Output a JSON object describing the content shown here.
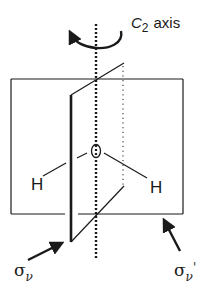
{
  "diagram": {
    "molecule": {
      "central_atom": "O",
      "atoms": [
        {
          "label": "H",
          "position": "left"
        },
        {
          "label": "H",
          "position": "right"
        }
      ]
    },
    "labels": {
      "axis_main": "C",
      "axis_sub": "2",
      "axis_word": "axis",
      "sigma_v": "σ",
      "sigma_v_sub": "ν",
      "sigma_v_prime": "σ",
      "sigma_v_prime_sub": "ν",
      "sigma_v_prime_mark": "'"
    },
    "elements": [
      {
        "name": "C2 axis",
        "style": "thick dotted vertical line with rotation arrow"
      },
      {
        "name": "σv",
        "style": "plane containing the molecule (front, thick edge)"
      },
      {
        "name": "σv'",
        "style": "perpendicular plane (back rectangle)"
      }
    ],
    "colors": {
      "stroke": "#1a1a1a",
      "background": "#ffffff"
    }
  }
}
